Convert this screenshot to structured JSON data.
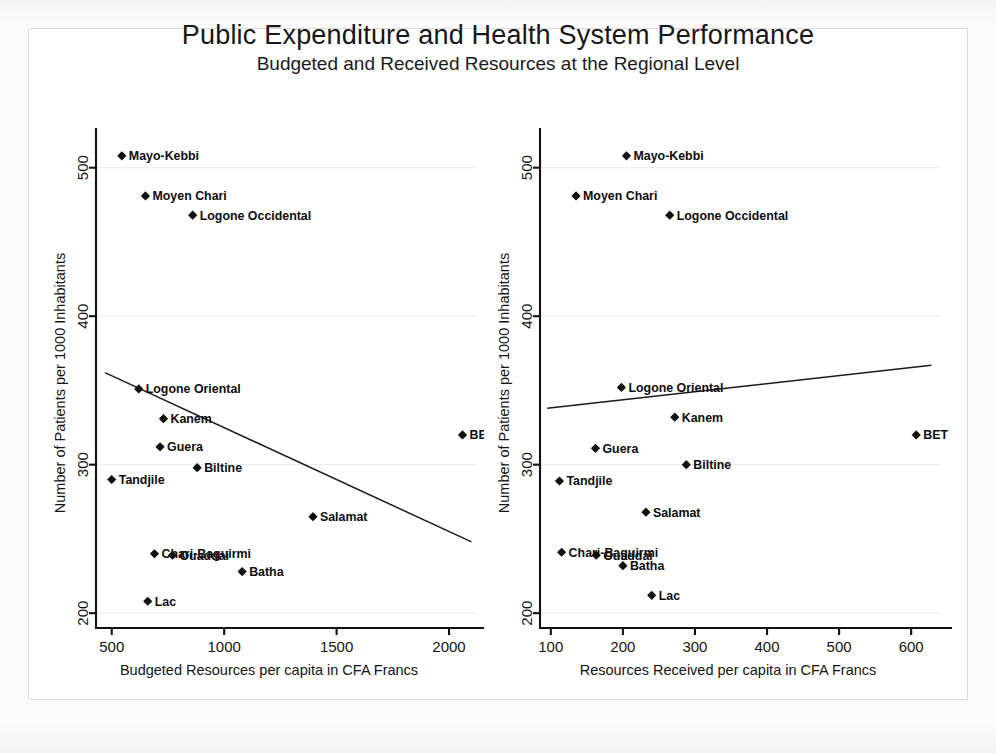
{
  "title": "Public Expenditure and Health System Performance",
  "subtitle": "Budgeted and Received Resources at the Regional Level",
  "chart_data": [
    {
      "id": "left",
      "type": "scatter",
      "title": "",
      "xlabel": "Budgeted Resources per capita in CFA Francs",
      "ylabel": "Number of Patients per 1000 Inhabitants",
      "xlim": [
        430,
        2120
      ],
      "ylim": [
        190,
        520
      ],
      "xticks": [
        500,
        1000,
        1500,
        2000
      ],
      "yticks": [
        200,
        300,
        400,
        500
      ],
      "grid": "horizontal-faint",
      "legend": "none",
      "points": [
        {
          "label": "Mayo-Kebbi",
          "x": 545,
          "y": 508,
          "label_pos": "right"
        },
        {
          "label": "Moyen Chari",
          "x": 650,
          "y": 481,
          "label_pos": "right"
        },
        {
          "label": "Logone Occidental",
          "x": 860,
          "y": 468,
          "label_pos": "right"
        },
        {
          "label": "Logone Oriental",
          "x": 620,
          "y": 351,
          "label_pos": "right"
        },
        {
          "label": "Kanem",
          "x": 730,
          "y": 331,
          "label_pos": "right"
        },
        {
          "label": "Guera",
          "x": 715,
          "y": 312,
          "label_pos": "right"
        },
        {
          "label": "Biltine",
          "x": 880,
          "y": 298,
          "label_pos": "right"
        },
        {
          "label": "Tandjile",
          "x": 500,
          "y": 290,
          "label_pos": "right"
        },
        {
          "label": "BET",
          "x": 2060,
          "y": 320,
          "label_pos": "right"
        },
        {
          "label": "Salamat",
          "x": 1395,
          "y": 265,
          "label_pos": "right"
        },
        {
          "label": "Chari-Baguirmi",
          "x": 690,
          "y": 240,
          "label_pos": "right"
        },
        {
          "label": "Ouaddai",
          "x": 770,
          "y": 239,
          "label_pos": "right"
        },
        {
          "label": "Batha",
          "x": 1080,
          "y": 228,
          "label_pos": "right"
        },
        {
          "label": "Lac",
          "x": 660,
          "y": 208,
          "label_pos": "right"
        }
      ],
      "fit_line": {
        "x0": 470,
        "y0": 362,
        "x1": 2100,
        "y1": 248
      }
    },
    {
      "id": "right",
      "type": "scatter",
      "title": "",
      "xlabel": "Resources Received per capita in CFA Francs",
      "ylabel": "Number of Patients per 1000 Inhabitants",
      "xlim": [
        85,
        640
      ],
      "ylim": [
        190,
        520
      ],
      "xticks": [
        100,
        200,
        300,
        400,
        500,
        600
      ],
      "yticks": [
        200,
        300,
        400,
        500
      ],
      "grid": "horizontal-faint",
      "legend": "none",
      "points": [
        {
          "label": "Mayo-Kebbi",
          "x": 205,
          "y": 508,
          "label_pos": "right"
        },
        {
          "label": "Moyen Chari",
          "x": 135,
          "y": 481,
          "label_pos": "right"
        },
        {
          "label": "Logone Occidental",
          "x": 265,
          "y": 468,
          "label_pos": "right"
        },
        {
          "label": "Logone Oriental",
          "x": 198,
          "y": 352,
          "label_pos": "right"
        },
        {
          "label": "Kanem",
          "x": 272,
          "y": 332,
          "label_pos": "right"
        },
        {
          "label": "Guera",
          "x": 162,
          "y": 311,
          "label_pos": "right"
        },
        {
          "label": "Biltine",
          "x": 288,
          "y": 300,
          "label_pos": "right"
        },
        {
          "label": "Tandjile",
          "x": 112,
          "y": 289,
          "label_pos": "right"
        },
        {
          "label": "BET",
          "x": 607,
          "y": 320,
          "label_pos": "right"
        },
        {
          "label": "Salamat",
          "x": 232,
          "y": 268,
          "label_pos": "right"
        },
        {
          "label": "Chari-Baguirmi",
          "x": 115,
          "y": 241,
          "label_pos": "right"
        },
        {
          "label": "Ouaddai",
          "x": 163,
          "y": 239,
          "label_pos": "right"
        },
        {
          "label": "Batha",
          "x": 200,
          "y": 232,
          "label_pos": "right"
        },
        {
          "label": "Lac",
          "x": 240,
          "y": 212,
          "label_pos": "right"
        }
      ],
      "fit_line": {
        "x0": 95,
        "y0": 338,
        "x1": 628,
        "y1": 367
      }
    }
  ]
}
